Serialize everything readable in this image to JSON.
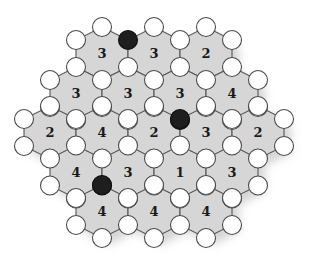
{
  "game": {
    "title": "Hexagonal number-node puzzle board",
    "colors": {
      "background": "#ffffff",
      "hex_fill": "#d6d6d6",
      "hex_stroke": "#555555",
      "node_empty": "#ffffff",
      "node_filled": "#1e1e1e",
      "number_text": "#1a1a1a"
    },
    "hex_geometry": {
      "half_width": 26,
      "top_offset": 26.5,
      "side_offset": 13.5
    },
    "node_radius": 9.5,
    "hexes": [
      {
        "cx": 102,
        "cy": 53.5,
        "value": "3"
      },
      {
        "cx": 154,
        "cy": 53.5,
        "value": "3"
      },
      {
        "cx": 206,
        "cy": 53.5,
        "value": "2"
      },
      {
        "cx": 76,
        "cy": 93.5,
        "value": "3"
      },
      {
        "cx": 128,
        "cy": 93.5,
        "value": "3"
      },
      {
        "cx": 180,
        "cy": 93.5,
        "value": "3"
      },
      {
        "cx": 232,
        "cy": 93.5,
        "value": "4"
      },
      {
        "cx": 50,
        "cy": 132.5,
        "value": "2"
      },
      {
        "cx": 102,
        "cy": 132.5,
        "value": "4"
      },
      {
        "cx": 154,
        "cy": 132.5,
        "value": "2"
      },
      {
        "cx": 206,
        "cy": 132.5,
        "value": "3"
      },
      {
        "cx": 258,
        "cy": 132.5,
        "value": "2"
      },
      {
        "cx": 76,
        "cy": 172,
        "value": "4"
      },
      {
        "cx": 128,
        "cy": 172,
        "value": "3"
      },
      {
        "cx": 180,
        "cy": 172,
        "value": "1"
      },
      {
        "cx": 232,
        "cy": 172,
        "value": "3"
      },
      {
        "cx": 102,
        "cy": 211.5,
        "value": "4"
      },
      {
        "cx": 154,
        "cy": 211.5,
        "value": "4"
      },
      {
        "cx": 206,
        "cy": 211.5,
        "value": "4"
      }
    ],
    "filled_nodes": [
      {
        "x": 128,
        "y": 40
      },
      {
        "x": 180,
        "y": 119
      },
      {
        "x": 102,
        "y": 185
      }
    ]
  }
}
